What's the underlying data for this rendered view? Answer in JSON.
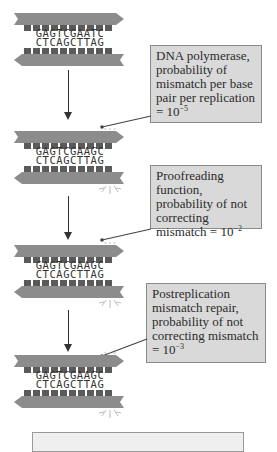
{
  "diagram": {
    "dna_stages": [
      {
        "top_strand": "GAGTCGAATC",
        "bottom_strand": "CTCAGCTTAG",
        "has_mismatch_marker": false
      },
      {
        "top_strand": "GAGTCGAAGC",
        "bottom_strand": "CTCAGCTTAG",
        "has_mismatch_marker": true
      },
      {
        "top_strand": "GAGTCGAAGC",
        "bottom_strand": "CTCAGCTTAG",
        "has_mismatch_marker": true
      },
      {
        "top_strand": "GAGTCGAAGC",
        "bottom_strand": "CTCAGCTTAG",
        "has_mismatch_marker": true
      }
    ],
    "callouts": [
      {
        "text_main": "DNA polymerase, probability of mismatch per base pair per replication = 10",
        "exponent": "−5"
      },
      {
        "text_main": "Proofreading function, probability of not correcting mismatch = 10",
        "exponent": "−2"
      },
      {
        "text_main": "Postreplication mismatch repair, probability of not correcting mismatch = 10",
        "exponent": "−3"
      }
    ],
    "summary_box": {
      "text": ""
    },
    "colors": {
      "strand": "#8c8c8c",
      "base_block": "#5a5a5a",
      "callout_fill": "#d9d9d9",
      "callout_border": "#8a8a8a",
      "arrow": "#333333"
    }
  }
}
